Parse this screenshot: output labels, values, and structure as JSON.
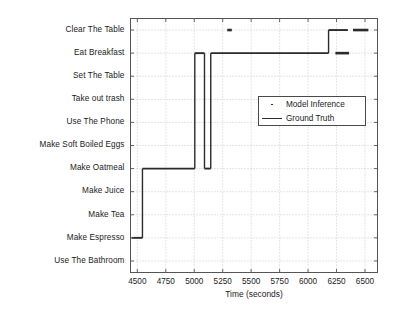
{
  "chart_data": {
    "type": "line",
    "title": "",
    "xlabel": "Time (seconds)",
    "ylabel": "",
    "xlim": [
      4440,
      6610
    ],
    "xticks": [
      4500,
      4750,
      5000,
      5250,
      5500,
      5750,
      6000,
      6250,
      6500
    ],
    "xticklabels": [
      "4500",
      "4750",
      "5000",
      "5250",
      "5500",
      "5750",
      "6000",
      "6250",
      "6500"
    ],
    "categories": [
      "Clear The Table",
      "Eat Breakfast",
      "Set The Table",
      "Take out trash",
      "Use The Phone",
      "Make Soft Boiled Eggs",
      "Make Oatmeal",
      "Make Juice",
      "Make Tea",
      "Make Espresso",
      "Use The Bathroom"
    ],
    "grid": true,
    "legend_position": "center-right",
    "series": [
      {
        "name": "Ground Truth",
        "style": "line",
        "color": "#2b2b2b",
        "segments": [
          {
            "category": "Make Espresso",
            "x_start": 4450,
            "x_end": 4545
          },
          {
            "category": "Make Oatmeal",
            "x_start": 4545,
            "x_end": 5005
          },
          {
            "category": "Eat Breakfast",
            "x_start": 5005,
            "x_end": 5090
          },
          {
            "category": "Make Oatmeal",
            "x_start": 5090,
            "x_end": 5145
          },
          {
            "category": "Eat Breakfast",
            "x_start": 5145,
            "x_end": 6180
          },
          {
            "category": "Clear The Table",
            "x_start": 6180,
            "x_end": 6350
          }
        ]
      },
      {
        "name": "Model Inference",
        "style": "marker",
        "color": "#2b2b2b",
        "segments": [
          {
            "category": "Clear The Table",
            "x_start": 5290,
            "x_end": 5330
          },
          {
            "category": "Eat Breakfast",
            "x_start": 6240,
            "x_end": 6360
          },
          {
            "category": "Clear The Table",
            "x_start": 6395,
            "x_end": 6530
          }
        ]
      }
    ]
  },
  "legend": {
    "entries": [
      {
        "label": "Model Inference",
        "marker": "dot"
      },
      {
        "label": "Ground Truth",
        "marker": "line"
      }
    ]
  }
}
